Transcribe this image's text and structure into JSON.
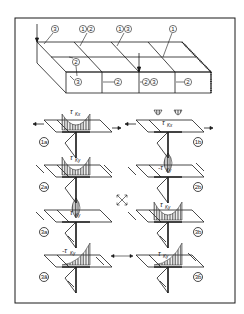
{
  "figure": {
    "type": "technical-diagram",
    "frame": true
  },
  "top_block": {
    "top_callouts": [
      "3",
      "1 2",
      "1 3",
      "1"
    ],
    "middle_callouts": [
      "2"
    ],
    "front_face_callouts": [
      "3",
      "2",
      "2 3",
      "2"
    ]
  },
  "panels": [
    {
      "id": "1a",
      "label": "1a",
      "tau": "τ",
      "tau_sub": "Kx",
      "sign": "",
      "column": "left"
    },
    {
      "id": "1b",
      "label": "1b",
      "tau": "τ",
      "tau_sub": "Kx",
      "sign": "",
      "column": "right"
    },
    {
      "id": "2a",
      "label": "2a",
      "tau": "τ",
      "tau_sub": "Ky",
      "sign": "",
      "column": "left"
    },
    {
      "id": "2b",
      "label": "2b",
      "tau": "τ",
      "tau_sub": "Ky",
      "sign": "-",
      "column": "right"
    },
    {
      "id": "3a",
      "label": "3a",
      "tau": "τ",
      "tau_sub": "Ky",
      "sign": "",
      "column": "left"
    },
    {
      "id": "3b",
      "label": "3b",
      "tau": "τ",
      "tau_sub": "Ky",
      "sign": "",
      "column": "right"
    },
    {
      "id": "3a2",
      "label": "3ã",
      "tau": "τ",
      "tau_sub": "Ky",
      "sign": "-",
      "column": "left"
    },
    {
      "id": "3b2",
      "label": "3b̃",
      "tau": "τ",
      "tau_sub": "Ky",
      "sign": "",
      "column": "right"
    }
  ],
  "symbols": {
    "cross_arrows": "four-way diagonal arrows",
    "double_arrow": "↔"
  },
  "colors": {
    "ink": "#1a1a1a",
    "background": "#ffffff",
    "hatch": "#555555"
  }
}
